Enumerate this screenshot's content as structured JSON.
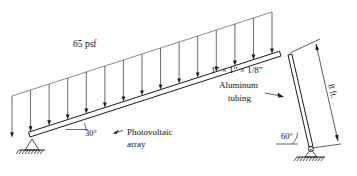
{
  "diagram": {
    "labels": {
      "distributed_load": "65 psf",
      "incline_angle": "30°",
      "post_angle": "60°",
      "array_label_line1": "Photovoltaic",
      "array_label_line2": "array",
      "tubing_spec": "1” × 1” × 1/8”",
      "tubing_material": "Aluminum",
      "tubing_type": "tubing",
      "post_height": "8 ft."
    },
    "geometry": {
      "beam_start_x": 30,
      "beam_start_y": 137,
      "beam_end_x": 281,
      "beam_end_y": 56,
      "beam_thickness": 5,
      "load_line_start_x": 12,
      "load_line_start_y": 96,
      "load_line_end_x": 272,
      "load_line_end_y": 12,
      "post_top_x": 288,
      "post_top_y": 55,
      "post_bottom_x": 309,
      "post_bottom_y": 147,
      "post_thickness": 4,
      "arrow_count": 15,
      "dim_top_x": 316,
      "dim_top_y": 44,
      "dim_bottom_x": 338,
      "dim_bottom_y": 141,
      "ground_left_y": 150,
      "ground_right_y": 157
    },
    "colors": {
      "ink": "#1a1a1a",
      "load_ink": "#3a3a3a",
      "background": "#ffffff"
    }
  }
}
